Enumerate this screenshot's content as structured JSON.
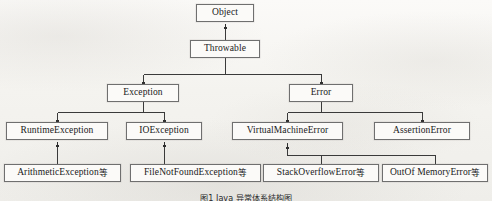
{
  "figure": {
    "kind": "class-hierarchy-diagram",
    "background_color": "#f7f6f3",
    "box_border_color": "#6f6f6f",
    "box_fill_color": "#fbfaf8",
    "text_color": "#19191a",
    "edge_color": "#3a3a3a",
    "caption": "图1  Java 异常体系结构图"
  },
  "nodes": [
    {
      "id": "object",
      "label": "Object",
      "cjk_suffix": "",
      "x": 196,
      "y": 4,
      "w": 58,
      "h": 18,
      "font_size": 9.5,
      "level": 1
    },
    {
      "id": "throwable",
      "label": "Throwable",
      "cjk_suffix": "",
      "x": 190,
      "y": 40,
      "w": 70,
      "h": 18,
      "font_size": 9.5,
      "level": 2
    },
    {
      "id": "exception",
      "label": "Exception",
      "cjk_suffix": "",
      "x": 107,
      "y": 84,
      "w": 72,
      "h": 18,
      "font_size": 9.5,
      "level": 3
    },
    {
      "id": "error",
      "label": "Error",
      "cjk_suffix": "",
      "x": 289,
      "y": 84,
      "w": 64,
      "h": 18,
      "font_size": 9.5,
      "level": 3
    },
    {
      "id": "runtime-exception",
      "label": "RuntimeException",
      "cjk_suffix": "",
      "x": 6,
      "y": 122,
      "w": 102,
      "h": 18,
      "font_size": 9.5,
      "level": 4
    },
    {
      "id": "io-exception",
      "label": "IOException",
      "cjk_suffix": "",
      "x": 126,
      "y": 122,
      "w": 76,
      "h": 18,
      "font_size": 9.5,
      "level": 4
    },
    {
      "id": "virtual-machine-error",
      "label": "VirtualMachineError",
      "cjk_suffix": "",
      "x": 232,
      "y": 122,
      "w": 111,
      "h": 18,
      "font_size": 9.5,
      "level": 4
    },
    {
      "id": "assertion-error",
      "label": "AssertionError",
      "cjk_suffix": "",
      "x": 374,
      "y": 122,
      "w": 96,
      "h": 18,
      "font_size": 9.5,
      "level": 4
    },
    {
      "id": "arithmetic-exception",
      "label": "ArithmeticException",
      "cjk_suffix": "等",
      "x": 4,
      "y": 164,
      "w": 117,
      "h": 18,
      "font_size": 9.5,
      "level": 5
    },
    {
      "id": "file-not-found-exception",
      "label": "FileNotFoundException",
      "cjk_suffix": "等",
      "x": 130,
      "y": 164,
      "w": 131,
      "h": 18,
      "font_size": 9.5,
      "level": 5
    },
    {
      "id": "stack-overflow-error",
      "label": "StackOverflowError",
      "cjk_suffix": "等",
      "x": 263,
      "y": 164,
      "w": 116,
      "h": 18,
      "font_size": 9.5,
      "level": 5
    },
    {
      "id": "out-of-memory-error",
      "label": "OutOf MemoryError",
      "cjk_suffix": "等",
      "x": 382,
      "y": 164,
      "w": 106,
      "h": 18,
      "font_size": 9.5,
      "level": 5
    }
  ],
  "edges": [
    {
      "id": "throwable-to-object",
      "from": "throwable",
      "to": "object",
      "style": "direct-arrow"
    },
    {
      "id": "exception-to-throwable",
      "from": "exception",
      "to": "throwable",
      "style": "elbow-arrow"
    },
    {
      "id": "error-to-throwable",
      "from": "error",
      "to": "throwable",
      "style": "elbow-arrow"
    },
    {
      "id": "runtime-exception-to-exception",
      "from": "runtime-exception",
      "to": "exception",
      "style": "elbow-arrow"
    },
    {
      "id": "io-exception-to-exception",
      "from": "io-exception",
      "to": "exception",
      "style": "elbow-arrow"
    },
    {
      "id": "virtual-machine-error-to-error",
      "from": "virtual-machine-error",
      "to": "error",
      "style": "elbow-arrow"
    },
    {
      "id": "assertion-error-to-error",
      "from": "assertion-error",
      "to": "error",
      "style": "elbow-arrow"
    },
    {
      "id": "arithmetic-exception-to-runtime-exception",
      "from": "arithmetic-exception",
      "to": "runtime-exception",
      "style": "direct-arrow"
    },
    {
      "id": "file-not-found-exception-to-io-exception",
      "from": "file-not-found-exception",
      "to": "io-exception",
      "style": "direct-arrow"
    },
    {
      "id": "stack-overflow-error-to-virtual-machine-error",
      "from": "stack-overflow-error",
      "to": "virtual-machine-error",
      "style": "elbow-arrow"
    },
    {
      "id": "out-of-memory-error-to-virtual-machine-error",
      "from": "out-of-memory-error",
      "to": "virtual-machine-error",
      "style": "elbow-arrow"
    }
  ],
  "connector_geometry": {
    "throwable_object": {
      "x": 225,
      "y_top": 22,
      "y_bottom": 40
    },
    "throwable_children_bus": {
      "y": 74,
      "x_left": 143,
      "x_right": 321,
      "stem_x": 225,
      "stem_top": 58
    },
    "exception_children_bus": {
      "y": 112,
      "x_left": 57,
      "x_right": 164,
      "stem_x": 143,
      "stem_top": 102
    },
    "error_children_bus": {
      "y": 112,
      "x_left": 287,
      "x_right": 422,
      "stem_x": 321,
      "stem_top": 102
    },
    "runtime_arithmetic": {
      "x": 57,
      "y_top": 140,
      "y_bottom": 164
    },
    "io_filenotfound": {
      "x": 164,
      "y_top": 140,
      "y_bottom": 164
    },
    "vme_children_bus": {
      "y": 155,
      "x_left": 321,
      "x_right": 435,
      "stem_x": 287,
      "stem_top": 140
    }
  },
  "caption_position": {
    "x": 246,
    "y": 192,
    "clipped": true
  }
}
